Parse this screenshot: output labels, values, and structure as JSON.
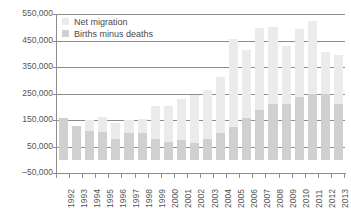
{
  "chart_data": {
    "type": "bar",
    "stacked": true,
    "title": "",
    "subtitle": "",
    "xlabel": "",
    "ylabel": "",
    "grid": true,
    "legend_position": "top-left",
    "ylim": [
      -50000,
      550000
    ],
    "ytick_labels": [
      "550,000",
      "450,000",
      "350,000",
      "250,000",
      "150,000",
      "50,000",
      "–50,000"
    ],
    "ytick_values": [
      550000,
      450000,
      350000,
      250000,
      150000,
      50000,
      -50000
    ],
    "categories": [
      "1992",
      "1993",
      "1994",
      "1995",
      "1996",
      "1997",
      "1998",
      "1999",
      "2000",
      "2001",
      "2002",
      "2003",
      "2004",
      "2005",
      "2006",
      "2007",
      "2008",
      "2009",
      "2010",
      "2011",
      "2012",
      "2013"
    ],
    "series": [
      {
        "name": "Births minus deaths",
        "color": "#d0d0d0",
        "values": [
          157000,
          127000,
          110000,
          104000,
          79000,
          100000,
          100000,
          78000,
          67000,
          76000,
          63000,
          78000,
          100000,
          123000,
          157000,
          187000,
          211000,
          209000,
          237000,
          249000,
          249000,
          212000
        ]
      },
      {
        "name": "Net migration",
        "color": "#ebebeb",
        "values": [
          0,
          0,
          40000,
          58000,
          58000,
          50000,
          55000,
          126000,
          136000,
          153000,
          183000,
          187000,
          213000,
          332000,
          256000,
          312000,
          290000,
          221000,
          256000,
          273000,
          159000,
          183000
        ]
      }
    ],
    "totals": [
      157000,
      127000,
      150000,
      162000,
      137000,
      150000,
      155000,
      204000,
      203000,
      229000,
      246000,
      265000,
      313000,
      455000,
      413000,
      499000,
      501000,
      430000,
      493000,
      522000,
      408000,
      395000
    ]
  },
  "legend": {
    "items": [
      {
        "label": "Net migration",
        "swatch": "migration"
      },
      {
        "label": "Births minus deaths",
        "swatch": "natural"
      }
    ]
  },
  "colors": {
    "net_migration": "#ebebeb",
    "births_minus_deaths": "#d0d0d0",
    "axis": "#8d8d8d",
    "grid": "#8d8d8d",
    "text": "#555555",
    "background": "#ffffff"
  }
}
